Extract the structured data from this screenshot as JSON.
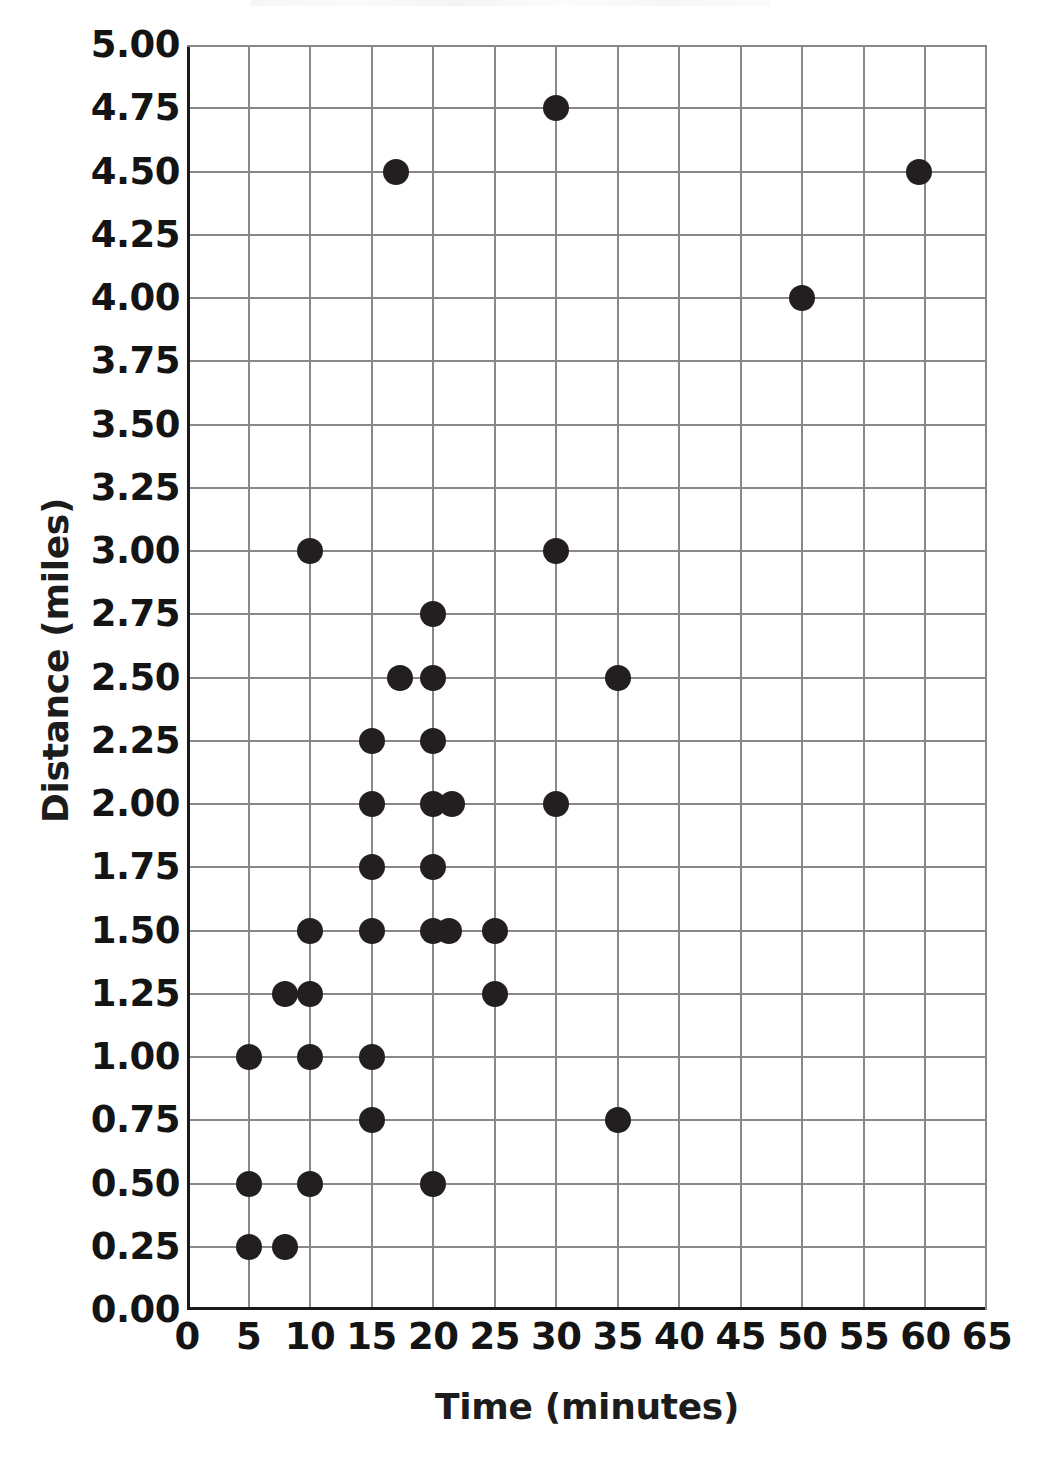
{
  "chart_data": {
    "type": "scatter",
    "title": "",
    "xlabel": "Time (minutes)",
    "ylabel": "Distance (miles)",
    "xlim": [
      0,
      65
    ],
    "ylim": [
      0,
      5
    ],
    "xticks": [
      "0",
      "5",
      "10",
      "15",
      "20",
      "25",
      "30",
      "35",
      "40",
      "45",
      "50",
      "55",
      "60",
      "65"
    ],
    "xtick_values": [
      0,
      5,
      10,
      15,
      20,
      25,
      30,
      35,
      40,
      45,
      50,
      55,
      60,
      65
    ],
    "yticks": [
      "0.00",
      "0.25",
      "0.50",
      "0.75",
      "1.00",
      "1.25",
      "1.50",
      "1.75",
      "2.00",
      "2.25",
      "2.50",
      "2.75",
      "3.00",
      "3.25",
      "3.50",
      "3.75",
      "4.00",
      "4.25",
      "4.50",
      "4.75",
      "5.00"
    ],
    "ytick_values": [
      0,
      0.25,
      0.5,
      0.75,
      1,
      1.25,
      1.5,
      1.75,
      2,
      2.25,
      2.5,
      2.75,
      3,
      3.25,
      3.5,
      3.75,
      4,
      4.25,
      4.5,
      4.75,
      5
    ],
    "grid": true,
    "grid_color": "#888888",
    "axis_color": "#1a1a1a",
    "marker_color": "#231f20",
    "marker_size_px": 26,
    "legend": null,
    "points": [
      {
        "x": 5,
        "y": 0.25
      },
      {
        "x": 8,
        "y": 0.25
      },
      {
        "x": 5,
        "y": 0.5
      },
      {
        "x": 10,
        "y": 0.5
      },
      {
        "x": 20,
        "y": 0.5
      },
      {
        "x": 15,
        "y": 0.75
      },
      {
        "x": 35,
        "y": 0.75
      },
      {
        "x": 5,
        "y": 1.0
      },
      {
        "x": 10,
        "y": 1.0
      },
      {
        "x": 15,
        "y": 1.0
      },
      {
        "x": 8,
        "y": 1.25
      },
      {
        "x": 10,
        "y": 1.25
      },
      {
        "x": 25,
        "y": 1.25
      },
      {
        "x": 10,
        "y": 1.5
      },
      {
        "x": 15,
        "y": 1.5
      },
      {
        "x": 20,
        "y": 1.5
      },
      {
        "x": 21.3,
        "y": 1.5
      },
      {
        "x": 25,
        "y": 1.5
      },
      {
        "x": 15,
        "y": 1.75
      },
      {
        "x": 20,
        "y": 1.75
      },
      {
        "x": 15,
        "y": 2.0
      },
      {
        "x": 20,
        "y": 2.0
      },
      {
        "x": 21.5,
        "y": 2.0
      },
      {
        "x": 30,
        "y": 2.0
      },
      {
        "x": 15,
        "y": 2.25
      },
      {
        "x": 20,
        "y": 2.25
      },
      {
        "x": 17.3,
        "y": 2.5
      },
      {
        "x": 20,
        "y": 2.5
      },
      {
        "x": 35,
        "y": 2.5
      },
      {
        "x": 20,
        "y": 2.75
      },
      {
        "x": 10,
        "y": 3.0
      },
      {
        "x": 30,
        "y": 3.0
      },
      {
        "x": 50,
        "y": 4.0
      },
      {
        "x": 17,
        "y": 4.5
      },
      {
        "x": 59.5,
        "y": 4.5
      },
      {
        "x": 30,
        "y": 4.75
      }
    ]
  }
}
